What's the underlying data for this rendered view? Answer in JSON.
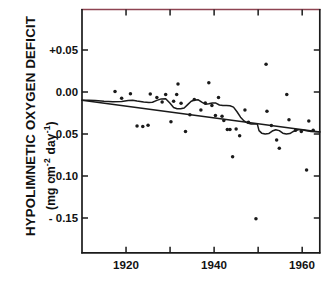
{
  "chart_data": {
    "type": "scatter",
    "title": "",
    "xlabel": "",
    "ylabel": "HYPOLIMNETIC OXYGEN DEFICIT",
    "ylabel_units": "(mg cm-2 day-1)",
    "xlim": [
      1910,
      1964
    ],
    "ylim": [
      -0.185,
      0.082
    ],
    "grid": false,
    "legend": "none",
    "x_ticks": [
      1920,
      1930,
      1940,
      1950,
      1960
    ],
    "x_tick_labels": [
      "1920",
      "",
      "1940",
      "",
      "1960"
    ],
    "y_ticks": [
      0.05,
      0.0,
      -0.05,
      -0.1,
      -0.15
    ],
    "y_tick_labels": [
      "+0.05",
      "0.00",
      "- 0.05",
      "- 0.10",
      "- 0.15"
    ],
    "axis_color": "#1a1a1a",
    "top_frame_color": "#8e4452",
    "marker_color": "#1a1a1a",
    "line_color": "#1a1a1a",
    "points": [
      [
        1917.5,
        0.0005
      ],
      [
        1919.0,
        -0.0075
      ],
      [
        1921.0,
        -0.002
      ],
      [
        1922.5,
        -0.0405
      ],
      [
        1923.8,
        -0.041
      ],
      [
        1925.0,
        -0.0395
      ],
      [
        1925.5,
        -0.0025
      ],
      [
        1927.0,
        -0.0065
      ],
      [
        1928.2,
        -0.012
      ],
      [
        1929.0,
        -0.003
      ],
      [
        1930.2,
        -0.0355
      ],
      [
        1930.8,
        -0.011
      ],
      [
        1931.5,
        -0.003
      ],
      [
        1931.8,
        0.0095
      ],
      [
        1932.5,
        -0.0135
      ],
      [
        1933.5,
        -0.047
      ],
      [
        1934.5,
        -0.027
      ],
      [
        1935.5,
        -0.009
      ],
      [
        1937.0,
        -0.0215
      ],
      [
        1938.0,
        -0.013
      ],
      [
        1938.8,
        0.011
      ],
      [
        1939.5,
        -0.016
      ],
      [
        1940.3,
        -0.028
      ],
      [
        1941.0,
        -0.0065
      ],
      [
        1941.8,
        -0.029
      ],
      [
        1942.2,
        -0.034
      ],
      [
        1943.0,
        -0.0445
      ],
      [
        1943.6,
        -0.0445
      ],
      [
        1944.2,
        -0.077
      ],
      [
        1945.0,
        -0.044
      ],
      [
        1945.8,
        -0.052
      ],
      [
        1947.0,
        -0.0215
      ],
      [
        1947.8,
        -0.036
      ],
      [
        1949.5,
        -0.151
      ],
      [
        1951.8,
        0.033
      ],
      [
        1952.0,
        -0.023
      ],
      [
        1953.0,
        -0.04
      ],
      [
        1954.2,
        -0.057
      ],
      [
        1954.8,
        -0.067
      ],
      [
        1956.5,
        -0.003
      ],
      [
        1957.0,
        -0.033
      ],
      [
        1958.5,
        -0.0455
      ],
      [
        1959.8,
        -0.047
      ],
      [
        1961.0,
        -0.093
      ],
      [
        1961.5,
        -0.0345
      ],
      [
        1962.5,
        -0.0455
      ]
    ],
    "trend_line": {
      "name": "linear regression",
      "points": [
        [
          1910,
          -0.0097
        ],
        [
          1964,
          -0.0477
        ]
      ]
    },
    "smooth_line": {
      "name": "moving average",
      "points": [
        [
          1910.0,
          -0.0098
        ],
        [
          1911.5,
          -0.0097
        ],
        [
          1913.0,
          -0.01
        ],
        [
          1915.0,
          -0.011
        ],
        [
          1917.0,
          -0.0115
        ],
        [
          1919.0,
          -0.0112
        ],
        [
          1920.5,
          -0.01
        ],
        [
          1921.5,
          -0.0098
        ],
        [
          1922.5,
          -0.0108
        ],
        [
          1924.0,
          -0.012
        ],
        [
          1925.2,
          -0.0125
        ],
        [
          1926.0,
          -0.0122
        ],
        [
          1927.0,
          -0.01
        ],
        [
          1928.0,
          -0.0082
        ],
        [
          1929.0,
          -0.008
        ],
        [
          1930.0,
          -0.0135
        ],
        [
          1930.8,
          -0.0185
        ],
        [
          1931.6,
          -0.02
        ],
        [
          1932.4,
          -0.02
        ],
        [
          1933.2,
          -0.019
        ],
        [
          1934.0,
          -0.015
        ],
        [
          1934.8,
          -0.011
        ],
        [
          1935.6,
          -0.0095
        ],
        [
          1936.4,
          -0.0093
        ],
        [
          1937.2,
          -0.012
        ],
        [
          1938.0,
          -0.0145
        ],
        [
          1938.8,
          -0.014
        ],
        [
          1939.6,
          -0.013
        ],
        [
          1940.4,
          -0.0132
        ],
        [
          1941.2,
          -0.0155
        ],
        [
          1942.0,
          -0.016
        ],
        [
          1942.8,
          -0.016
        ],
        [
          1943.6,
          -0.0163
        ],
        [
          1944.4,
          -0.018
        ],
        [
          1945.2,
          -0.0235
        ],
        [
          1946.0,
          -0.03
        ],
        [
          1946.8,
          -0.0345
        ],
        [
          1947.6,
          -0.037
        ],
        [
          1948.4,
          -0.038
        ],
        [
          1949.2,
          -0.0378
        ],
        [
          1949.8,
          -0.038
        ],
        [
          1950.2,
          -0.046
        ],
        [
          1950.8,
          -0.049
        ],
        [
          1951.6,
          -0.05
        ],
        [
          1952.4,
          -0.0495
        ],
        [
          1953.2,
          -0.0465
        ],
        [
          1954.0,
          -0.045
        ],
        [
          1954.8,
          -0.046
        ],
        [
          1955.6,
          -0.049
        ],
        [
          1956.4,
          -0.05
        ],
        [
          1957.2,
          -0.0495
        ],
        [
          1958.0,
          -0.047
        ],
        [
          1959.0,
          -0.045
        ],
        [
          1960.0,
          -0.045
        ],
        [
          1961.0,
          -0.0462
        ],
        [
          1962.0,
          -0.047
        ],
        [
          1963.0,
          -0.0472
        ],
        [
          1964.0,
          -0.0473
        ]
      ]
    }
  },
  "axis": {
    "y_label_main": "HYPOLIMNETIC OXYGEN DEFICIT",
    "y_label_units_prefix": "(mg cm",
    "y_label_units_exp1": "-2",
    "y_label_units_mid": " day",
    "y_label_units_exp2": "-1",
    "y_label_units_suffix": ")",
    "y_tick_0": "+0.05",
    "y_tick_1": "0.00",
    "y_tick_2": "- 0.05",
    "y_tick_3": "- 0.10",
    "y_tick_4": "- 0.15",
    "x_tick_0": "1920",
    "x_tick_1": "1940",
    "x_tick_2": "1960"
  }
}
